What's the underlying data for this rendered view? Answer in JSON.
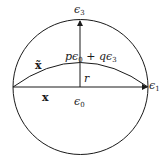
{
  "diagram": {
    "type": "geometric-figure",
    "labels": {
      "e3": {
        "base": "ϵ",
        "sub": "3"
      },
      "e1": {
        "base": "ϵ",
        "sub": "1"
      },
      "e0": {
        "base": "ϵ",
        "sub": "0"
      },
      "point": {
        "p": "p",
        "e0base": "ϵ",
        "e0sub": "0",
        "plus": " + ",
        "q": "q",
        "e3base": "ϵ",
        "e3sub": "3"
      },
      "r": "r",
      "x": "x",
      "x_tilde": "x̃"
    },
    "colors": {
      "stroke": "#1a1a1a",
      "background": "#ffffff"
    }
  }
}
